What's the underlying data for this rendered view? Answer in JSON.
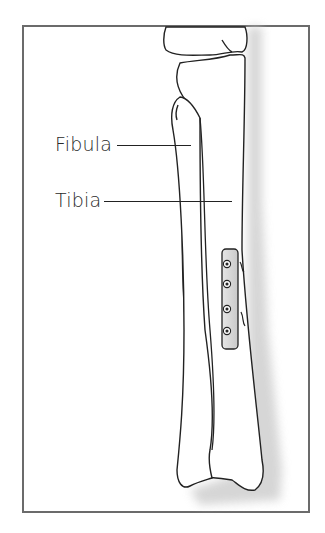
{
  "figure": {
    "labels": [
      {
        "id": "fibula",
        "text": "Fibula"
      },
      {
        "id": "tibia",
        "text": "Tibia"
      }
    ],
    "plate": {
      "screw_count": 4
    },
    "colors": {
      "frame": "#6b6b6b",
      "outline": "#222222",
      "bone_fill": "#ffffff",
      "shadow": "#d8d8d8",
      "plate_fill": "#d9d9d9",
      "text": "#2a2a2a"
    }
  }
}
